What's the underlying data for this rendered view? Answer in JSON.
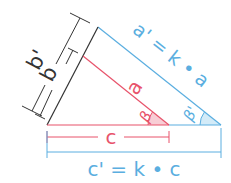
{
  "colors": {
    "red": "#e8536b",
    "red_fill": "#f8cdd5",
    "blue": "#5aaee0",
    "blue_fill": "#d3ebf8",
    "black": "#333333"
  },
  "labels": {
    "a": "a",
    "a_prime": "a' = k • a",
    "a_short": "a",
    "b": "b",
    "b_prime": "b'",
    "c": "c",
    "c_prime": "c' = k • c",
    "beta": "β",
    "beta_prime": "β'"
  },
  "diagram": {
    "small_triangle": {
      "sides": [
        "a",
        "b",
        "c"
      ],
      "angle": "β"
    },
    "large_triangle": {
      "sides": [
        "a'",
        "b'",
        "c'"
      ],
      "angle": "β'"
    },
    "relations": [
      "a' = k • a",
      "c' = k • c"
    ]
  }
}
